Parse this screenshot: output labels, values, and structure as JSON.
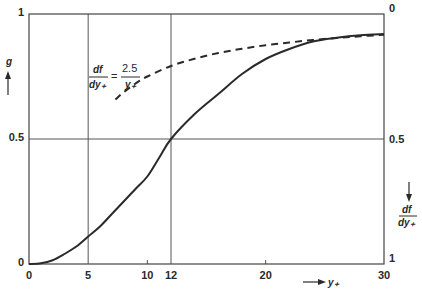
{
  "chart_data": {
    "type": "line",
    "title": "",
    "xlabel": "y+",
    "ylabel_left": "g",
    "ylabel_right": "df/dy+",
    "xlim": [
      0,
      30
    ],
    "ylim_left": [
      0,
      1
    ],
    "ylim_right": [
      1,
      0
    ],
    "x_ticks": [
      "0",
      "5",
      "10",
      "12",
      "20",
      "30"
    ],
    "y_ticks_left": [
      "0",
      "0.5",
      "1"
    ],
    "y_ticks_right": [
      "1",
      "0.5",
      "0"
    ],
    "grid": {
      "vertical": [
        5,
        12
      ],
      "horizontal": [
        0.5
      ]
    },
    "annotation": {
      "lhs_num": "df",
      "lhs_den": "dy+",
      "eq": "=",
      "rhs_num": "2.5",
      "rhs_den": "y+"
    },
    "series": [
      {
        "name": "g",
        "style": "solid",
        "axis": "left",
        "x": [
          0,
          1,
          2,
          3,
          4,
          5,
          6,
          7,
          8,
          9,
          10,
          11,
          12,
          14,
          16,
          18,
          20,
          22,
          24,
          26,
          28,
          30
        ],
        "values": [
          0,
          0.003,
          0.015,
          0.04,
          0.07,
          0.11,
          0.15,
          0.2,
          0.25,
          0.3,
          0.35,
          0.425,
          0.5,
          0.6,
          0.68,
          0.76,
          0.82,
          0.86,
          0.89,
          0.905,
          0.915,
          0.92
        ]
      },
      {
        "name": "df/dy+ = 2.5/y+",
        "style": "dashed",
        "axis": "right",
        "x": [
          7.3,
          8,
          9,
          10,
          12,
          14,
          16,
          18,
          20,
          22,
          24,
          26,
          28,
          30
        ],
        "values": [
          0.342,
          0.313,
          0.278,
          0.25,
          0.208,
          0.179,
          0.156,
          0.139,
          0.125,
          0.114,
          0.104,
          0.096,
          0.089,
          0.083
        ]
      }
    ]
  }
}
